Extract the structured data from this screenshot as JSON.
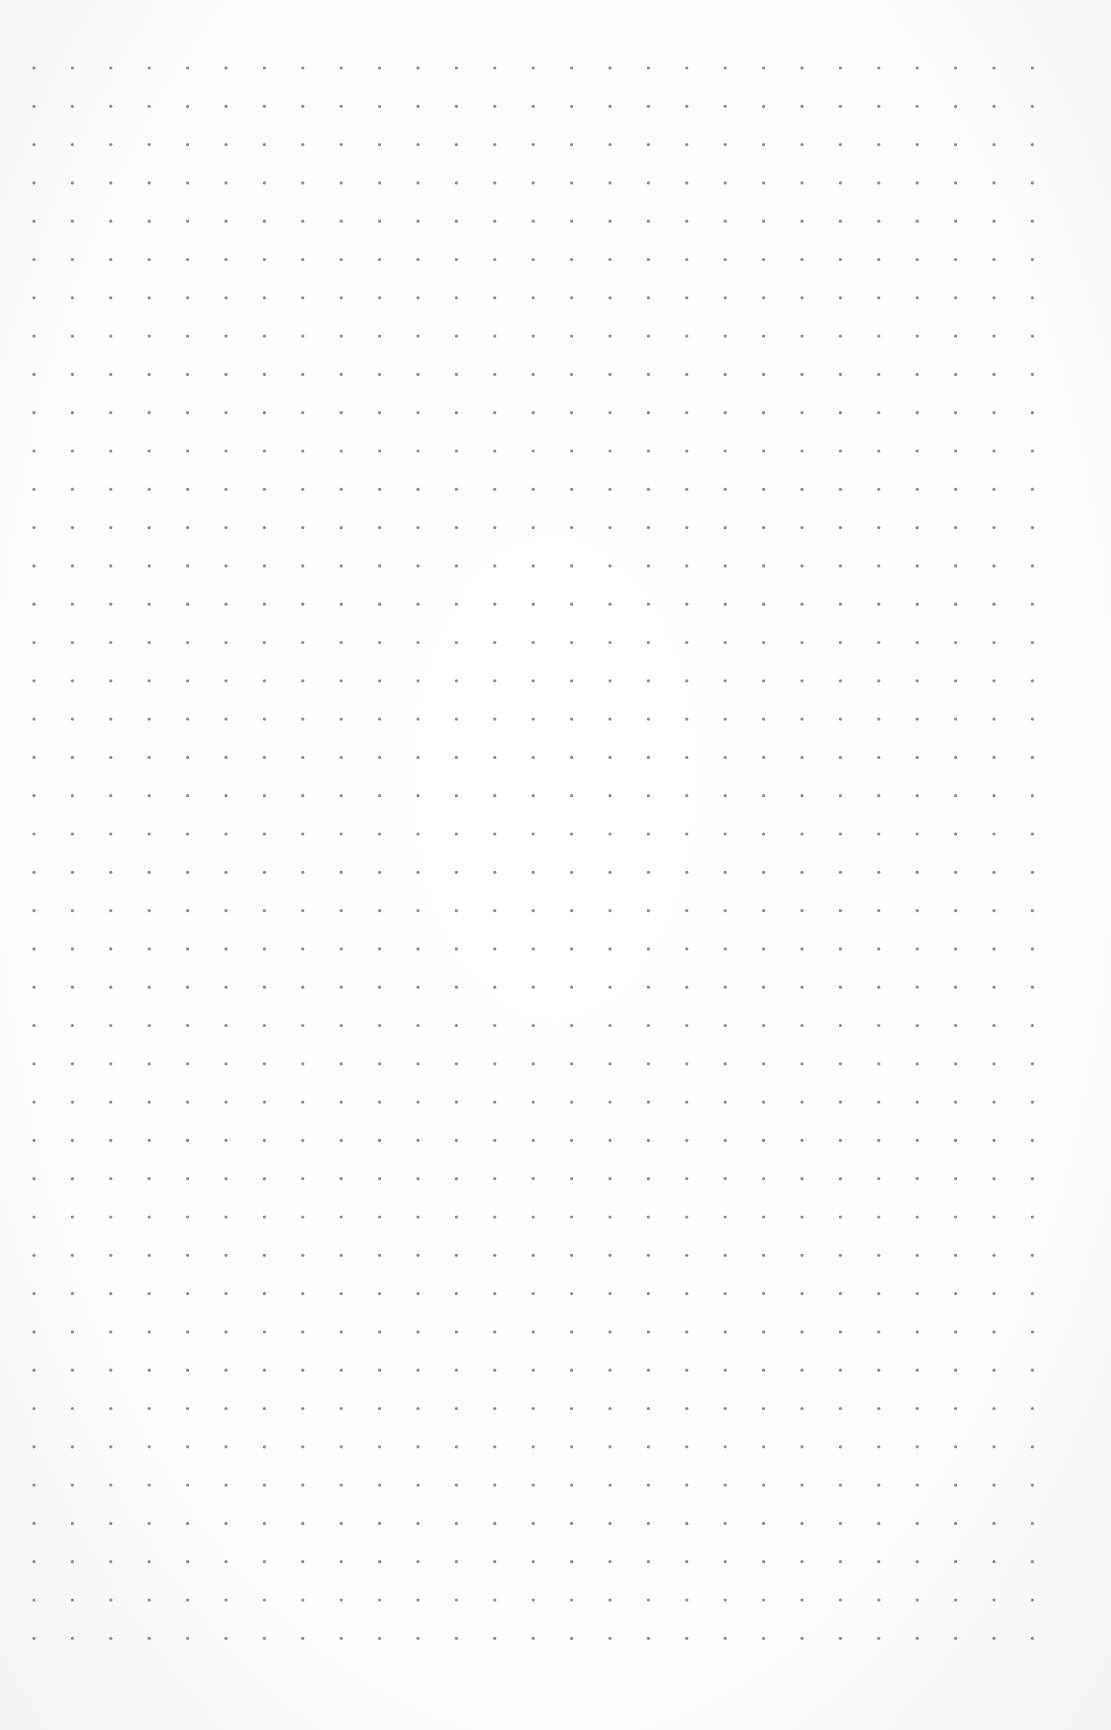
{
  "page": {
    "type": "dot-grid-paper",
    "background_color": "#ffffff",
    "dot_color": "#8a8a8a"
  },
  "grid": {
    "columns": 27,
    "rows": 42,
    "origin_x": 34,
    "origin_y": 68,
    "spacing_x": 38.4,
    "spacing_y": 38.3,
    "dot_radius": 1.6
  }
}
